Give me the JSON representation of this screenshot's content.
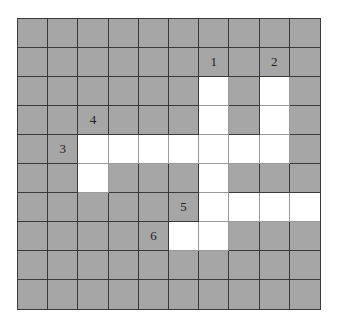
{
  "puzzle": {
    "type": "crossword",
    "rows": 10,
    "cols": 10,
    "colors": {
      "blocked": "#a6a6a6",
      "open": "#ffffff",
      "line": "#3a3a3a"
    },
    "open_cells": [
      [
        2,
        6
      ],
      [
        2,
        8
      ],
      [
        3,
        6
      ],
      [
        3,
        8
      ],
      [
        4,
        2
      ],
      [
        4,
        3
      ],
      [
        4,
        4
      ],
      [
        4,
        5
      ],
      [
        4,
        6
      ],
      [
        4,
        7
      ],
      [
        4,
        8
      ],
      [
        5,
        2
      ],
      [
        5,
        6
      ],
      [
        6,
        6
      ],
      [
        6,
        7
      ],
      [
        6,
        8
      ],
      [
        6,
        9
      ],
      [
        7,
        5
      ],
      [
        7,
        6
      ]
    ],
    "clue_numbers": [
      {
        "label": "1",
        "row": 1,
        "col": 6
      },
      {
        "label": "2",
        "row": 1,
        "col": 8
      },
      {
        "label": "3",
        "row": 4,
        "col": 1
      },
      {
        "label": "4",
        "row": 3,
        "col": 2
      },
      {
        "label": "5",
        "row": 6,
        "col": 5
      },
      {
        "label": "6",
        "row": 7,
        "col": 4
      }
    ]
  }
}
